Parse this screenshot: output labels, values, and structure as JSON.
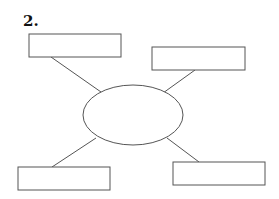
{
  "title": "2.",
  "diagram": {
    "type": "spider-map",
    "center": {
      "label": "",
      "shape": "ellipse",
      "cx": 133,
      "cy": 115,
      "rx": 50,
      "ry": 30
    },
    "boxes": [
      {
        "id": "top-left",
        "label": "",
        "x": 29,
        "y": 34,
        "w": 92,
        "h": 23,
        "line": [
          51,
          57,
          101,
          92
        ]
      },
      {
        "id": "top-right",
        "label": "",
        "x": 152,
        "y": 47,
        "w": 93,
        "h": 23,
        "line": [
          195,
          70,
          163,
          93
        ]
      },
      {
        "id": "bottom-left",
        "label": "",
        "x": 18,
        "y": 167,
        "w": 92,
        "h": 23,
        "line": [
          96,
          138,
          52,
          167
        ]
      },
      {
        "id": "bottom-right",
        "label": "",
        "x": 173,
        "y": 162,
        "w": 92,
        "h": 23,
        "line": [
          167,
          138,
          199,
          162
        ]
      }
    ],
    "stroke_color": "#555555"
  }
}
